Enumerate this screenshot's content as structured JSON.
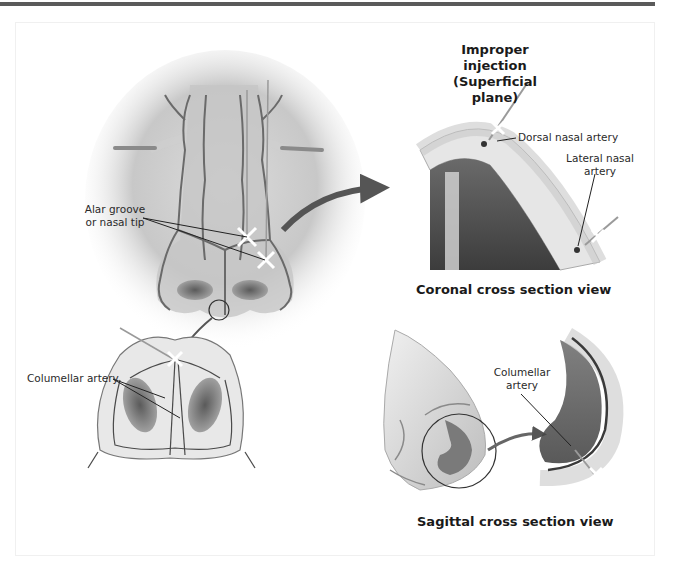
{
  "figure": {
    "coronal": {
      "title_line1": "Improper injection",
      "title_line2": "(Superficial plane)",
      "label_dorsal": "Dorsal nasal artery",
      "label_lateral_line1": "Lateral nasal",
      "label_lateral_line2": "artery",
      "caption": "Coronal cross section view"
    },
    "frontal": {
      "label_alar_line1": "Alar groove",
      "label_alar_line2": "or nasal tip"
    },
    "basal": {
      "label_columellar": "Columellar artery"
    },
    "sagittal": {
      "label_columellar_line1": "Columellar",
      "label_columellar_line2": "artery",
      "caption": "Sagittal cross section view"
    },
    "icons": [
      "arrow-right-curved",
      "needle-syringe",
      "magnify-circle"
    ]
  }
}
